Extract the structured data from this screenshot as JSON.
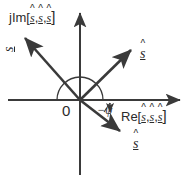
{
  "figure": {
    "background_color": "#ffffff",
    "stroke_color": "#3a3a3a",
    "text_color": "#2b2b2b",
    "width": 190,
    "height": 179
  },
  "axes": {
    "imaginary": {
      "label_prefix": "jIm[",
      "label_suffix": "]",
      "variable": "s",
      "variable_count": 3,
      "separator": ",",
      "orientation": "vertical"
    },
    "real": {
      "label_prefix": "Re[",
      "label_suffix": "]",
      "variable": "s",
      "variable_count": 3,
      "separator": ",",
      "orientation": "horizontal"
    },
    "origin_label": "0"
  },
  "annotations": {
    "angle_label": "−ψ",
    "angle_arc": "half-circle from positive real axis"
  },
  "vectors": [
    {
      "id": "v1",
      "name": "s-hat-upper-left",
      "label_variable": "s",
      "label_hat": "^",
      "label_underline": true,
      "angle_deg": 136,
      "tip": [
        22,
        35
      ],
      "rotated_label": true
    },
    {
      "id": "v2",
      "name": "s-hat-upper-right",
      "label_variable": "s",
      "label_hat": "^",
      "label_underline": true,
      "angle_deg": 44,
      "tip": [
        133,
        48
      ],
      "rotated_label": false
    },
    {
      "id": "v3",
      "name": "s-hat-lower-right",
      "label_variable": "s",
      "label_hat": "^",
      "label_underline": true,
      "angle_deg": -38,
      "tip": [
        122,
        133
      ],
      "rotated_label": false
    }
  ]
}
